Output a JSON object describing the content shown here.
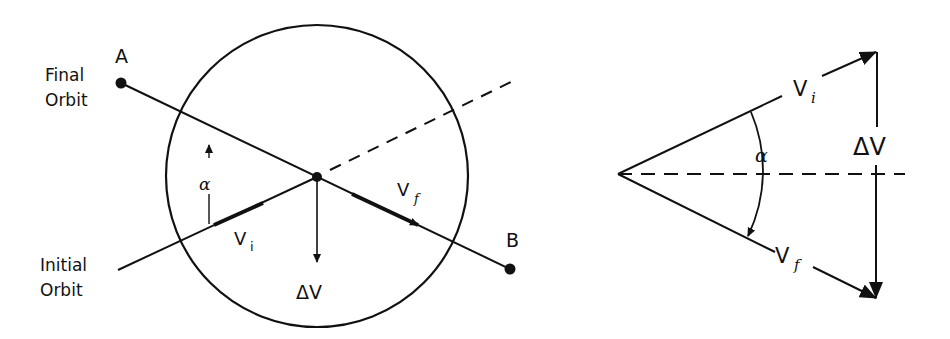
{
  "figure": {
    "left": {
      "labels": {
        "point_a": "A",
        "point_b": "B",
        "final_orbit_line1": "Final",
        "final_orbit_line2": "Orbit",
        "initial_orbit_line1": "Initial",
        "initial_orbit_line2": "Orbit",
        "alpha": "α",
        "v_i": "V",
        "v_i_sub": "i",
        "v_f": "V",
        "v_f_sub": "f",
        "delta_v": "ΔV"
      }
    },
    "right": {
      "labels": {
        "v_i": "V",
        "v_i_sub": "i",
        "v_f": "V",
        "v_f_sub": "f",
        "alpha": "α",
        "delta_v": "ΔV"
      }
    },
    "colors": {
      "ink": "#111111",
      "background": "#ffffff"
    }
  }
}
